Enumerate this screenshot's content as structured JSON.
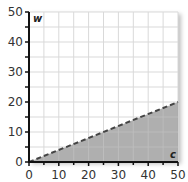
{
  "chart_data": {
    "type": "area",
    "title": "",
    "xlabel": "c",
    "ylabel": "w",
    "xlim": [
      0,
      50
    ],
    "ylim": [
      0,
      50
    ],
    "x_ticks": [
      0,
      10,
      20,
      30,
      40,
      50
    ],
    "y_ticks": [
      0,
      10,
      20,
      30,
      40,
      50
    ],
    "grid": true,
    "grid_step": 5,
    "series": [
      {
        "name": "boundary w = 0.4c",
        "style": "dashed",
        "x": [
          0,
          50
        ],
        "y": [
          0,
          20
        ]
      }
    ],
    "shaded_region": "below boundary line (w < 0.4c), c from 0 to 50",
    "colors": {
      "shade": "#a6a6a6",
      "line": "#444444",
      "grid": "#d9d9d9",
      "axis": "#111111"
    }
  },
  "labels": {
    "x_var": "c",
    "y_var": "w",
    "x_ticks": [
      "0",
      "10",
      "20",
      "30",
      "40",
      "50"
    ],
    "y_ticks": [
      "0",
      "10",
      "20",
      "30",
      "40",
      "50"
    ]
  }
}
